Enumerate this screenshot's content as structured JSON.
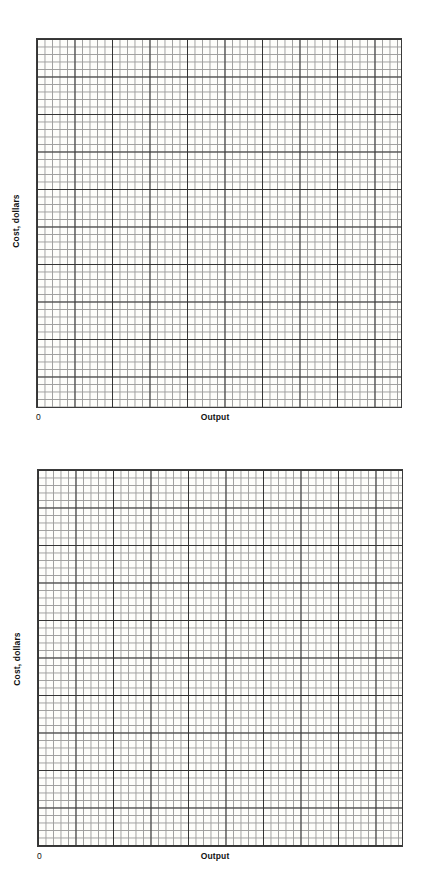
{
  "page": {
    "background_color": "#ffffff",
    "figure_count": 2
  },
  "charts": [
    {
      "id": "chart-1",
      "xlabel": "Output",
      "ylabel": "Cost, dollars",
      "origin_label": "0"
    },
    {
      "id": "chart-2",
      "xlabel": "Output",
      "ylabel": "Cost, dollars",
      "origin_label": "0"
    }
  ],
  "chart_data": [
    {
      "type": "line",
      "title": "",
      "subtitle": "",
      "xlabel": "Output",
      "ylabel": "Cost, dollars",
      "series": [],
      "x": [],
      "categories": [],
      "values": [],
      "annotations": [
        "0"
      ],
      "legend": [],
      "legend_position": "none",
      "grid": true,
      "grid_style": "graph-paper",
      "grid_minor_cells_x": 48,
      "grid_minor_cells_y": 49,
      "grid_major_every": 5,
      "grid_minor_color": "#8d8d8d",
      "grid_major_color": "#333333",
      "plot_background_color": "#fdfdfa",
      "border_color": "#3b3b3b",
      "axis_tick_labels_x": [],
      "axis_tick_labels_y": [],
      "xlim": [
        0,
        48
      ],
      "ylim": [
        0,
        49
      ],
      "note": "Blank graph-paper grid; no data plotted"
    },
    {
      "type": "line",
      "title": "",
      "subtitle": "",
      "xlabel": "Output",
      "ylabel": "Cost, dollars",
      "series": [],
      "x": [],
      "categories": [],
      "values": [],
      "annotations": [
        "0"
      ],
      "legend": [],
      "legend_position": "none",
      "grid": true,
      "grid_style": "graph-paper",
      "grid_minor_cells_x": 48,
      "grid_minor_cells_y": 50,
      "grid_major_every": 5,
      "grid_minor_color": "#8d8d8d",
      "grid_major_color": "#333333",
      "plot_background_color": "#fdfdfa",
      "border_color": "#3b3b3b",
      "axis_tick_labels_x": [],
      "axis_tick_labels_y": [],
      "xlim": [
        0,
        48
      ],
      "ylim": [
        0,
        50
      ],
      "note": "Blank graph-paper grid; no data plotted"
    }
  ]
}
